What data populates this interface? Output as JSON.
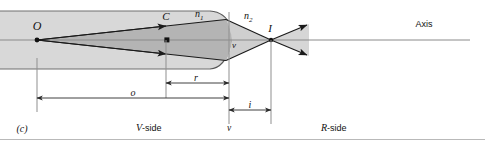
{
  "figure": {
    "caption_tag": "(c)",
    "axis_label": "Axis",
    "points": {
      "object": "O",
      "center": "C",
      "image": "I",
      "vertex": "v"
    },
    "media": {
      "left_index": "n",
      "left_index_sub": "1",
      "right_index": "n",
      "right_index_sub": "2"
    },
    "dimensions": [
      {
        "name": "object-distance",
        "label": "o"
      },
      {
        "name": "radius-of-curvature",
        "label": "r"
      },
      {
        "name": "image-distance",
        "label": "i"
      }
    ],
    "sides": {
      "left": "V",
      "left_suffix": "-side",
      "right": "R",
      "right_suffix": "-side"
    },
    "colors": {
      "slab_fill": "#d8d8d8",
      "cone_fill": "#b4b4b4",
      "outline": "#4a4a4a",
      "ray": "#1a1a1a",
      "axis": "#7a7a7a",
      "dimension": "#2b2b2b",
      "text": "#111111",
      "rule": "#b9b9b9"
    }
  }
}
